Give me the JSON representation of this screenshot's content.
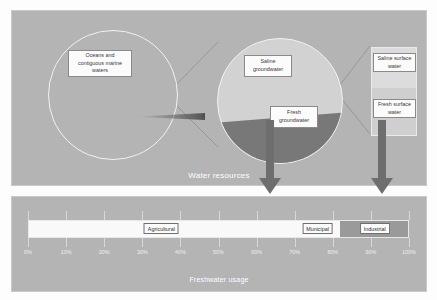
{
  "figure": {
    "panels": {
      "top": {
        "caption": "Water resources"
      },
      "bottom": {
        "caption": "Freshwater usage"
      }
    },
    "colors": {
      "panel_background": "#b4b4b4",
      "saline_groundwater": "#d2d2d2",
      "fresh_groundwater": "#787878",
      "saline_surface_water": "#dcdcdc",
      "fresh_surface_water": "#cfcfcf",
      "agricultural": "#f9f9f9",
      "municipal": "#f9f9f9",
      "industrial": "#9a9a9a",
      "arrow": "#6e6e6e",
      "circle_outline": "#f2f2f2",
      "caption_text": "#ffffff"
    },
    "labels": {
      "oceans": "Oceans and\ncontiguous marine\nwaters",
      "saline_groundwater": "Saline\ngroundwater",
      "fresh_groundwater": "Fresh\ngroundwater",
      "saline_surface_water": "Saline surface\nwater",
      "fresh_surface_water": "Fresh surface\nwater"
    }
  },
  "chart_data": [
    {
      "type": "pie",
      "title": "Water resources",
      "categories": [
        "Oceans and contiguous marine waters",
        "Groundwater and surface water"
      ],
      "values": [
        97.5,
        2.5
      ],
      "note": "Large circle: nearly all water is oceans; a thin sliver is magnified into the groundwater pie."
    },
    {
      "type": "pie",
      "title": "Groundwater",
      "categories": [
        "Saline groundwater",
        "Fresh groundwater"
      ],
      "values": [
        62,
        38
      ],
      "note": "Magnified sliver of the oceans circle; further magnified into the surface-water bar."
    },
    {
      "type": "bar",
      "title": "Surface water",
      "categories": [
        "Saline surface water",
        "Fresh surface water"
      ],
      "values": [
        46,
        54
      ],
      "orientation": "vertical",
      "note": "Magnified portion of the groundwater pie."
    },
    {
      "type": "bar",
      "title": "Freshwater usage",
      "orientation": "horizontal",
      "categories": [
        "Agricultural",
        "Municipal",
        "Industrial"
      ],
      "values": [
        70,
        12,
        18
      ],
      "cumulative_edges": [
        0,
        70,
        82,
        100
      ],
      "xlabel": "Freshwater usage",
      "ylabel": "",
      "xlim": [
        0,
        100
      ],
      "tick_labels": [
        "0%",
        "10%",
        "20%",
        "30%",
        "40%",
        "50%",
        "60%",
        "70%",
        "80%",
        "90%",
        "100%"
      ],
      "tick_values": [
        0,
        10,
        20,
        30,
        40,
        50,
        60,
        70,
        80,
        90,
        100
      ],
      "grid": false,
      "legend": "none"
    }
  ],
  "usage_bar": {
    "segments": [
      {
        "label": "Agricultural",
        "start": 0,
        "end": 70,
        "center": 35,
        "color": "#f9f9f9"
      },
      {
        "label": "Municipal",
        "start": 70,
        "end": 82,
        "center": 76,
        "color": "#f9f9f9"
      },
      {
        "label": "Industrial",
        "start": 82,
        "end": 100,
        "center": 91,
        "color": "#9a9a9a"
      }
    ],
    "axis_ticks": [
      "0%",
      "10%",
      "20%",
      "30%",
      "40%",
      "50%",
      "60%",
      "70%",
      "80%",
      "90%",
      "100%"
    ]
  }
}
